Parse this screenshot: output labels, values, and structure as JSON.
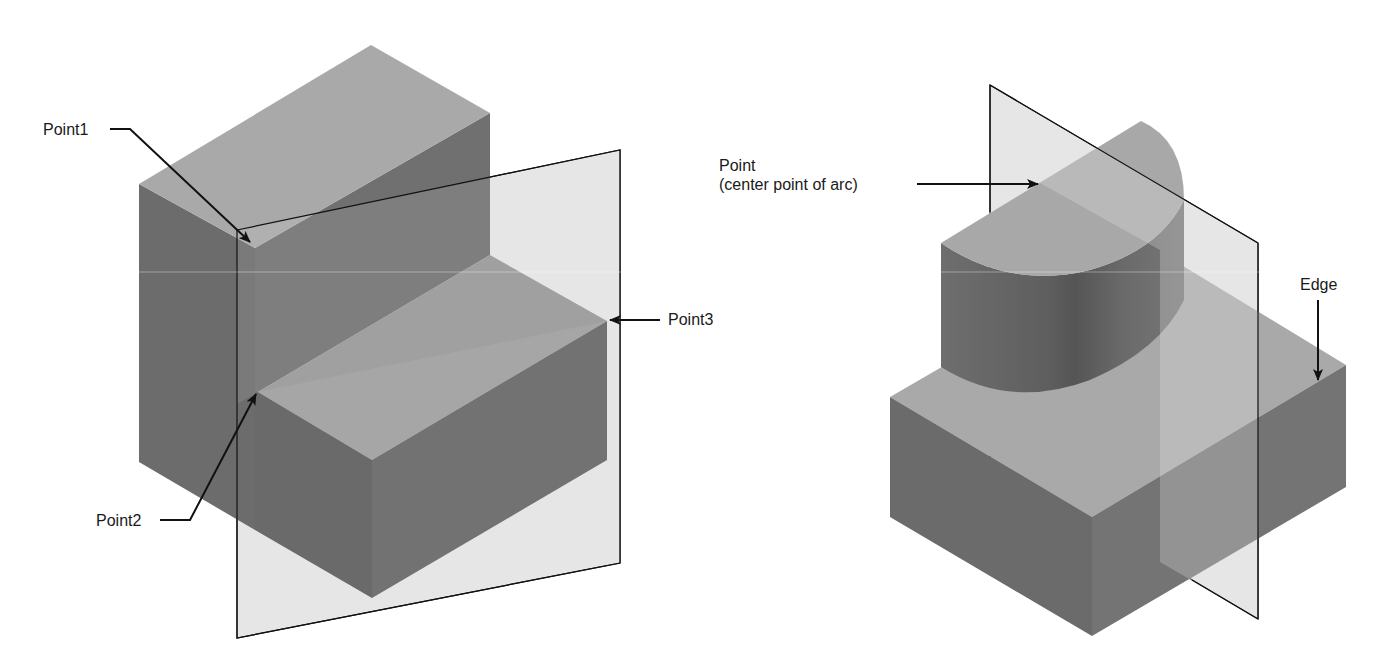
{
  "colors": {
    "background": "#ffffff",
    "face_dark": "#6b6b6b",
    "face_mid": "#7a7a7a",
    "face_light": "#a9a9a9",
    "plane_fill": "#e6e6e6",
    "line": "#111111"
  },
  "left_figure": {
    "description": "Stepped block with a work plane defined by three points",
    "labels": {
      "point1": "Point1",
      "point2": "Point2",
      "point3": "Point3"
    }
  },
  "right_figure": {
    "description": "Block with half-cylinder and a work plane defined by a point and an edge",
    "labels": {
      "point_line1": "Point",
      "point_line2": "(center point of arc)",
      "edge": "Edge"
    }
  }
}
